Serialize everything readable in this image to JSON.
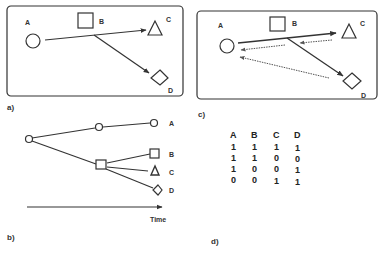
{
  "panels": {
    "a": {
      "caption": "a)",
      "nodes": [
        {
          "id": "A",
          "label": "A",
          "shape": "circle"
        },
        {
          "id": "B",
          "label": "B",
          "shape": "square"
        },
        {
          "id": "C",
          "label": "C",
          "shape": "triangle"
        },
        {
          "id": "D",
          "label": "D",
          "shape": "diamond"
        }
      ],
      "edges": [
        {
          "from": "A",
          "to": "C",
          "style": "solid"
        },
        {
          "from": "B",
          "to": "D",
          "style": "solid"
        }
      ]
    },
    "b": {
      "caption": "b)",
      "axis_label": "Time",
      "leaves": [
        {
          "id": "A",
          "label": "A",
          "shape": "circle"
        },
        {
          "id": "B",
          "label": "B",
          "shape": "square"
        },
        {
          "id": "C",
          "label": "C",
          "shape": "triangle"
        },
        {
          "id": "D",
          "label": "D",
          "shape": "diamond"
        }
      ]
    },
    "c": {
      "caption": "c)",
      "nodes": [
        {
          "id": "A",
          "label": "A",
          "shape": "circle"
        },
        {
          "id": "B",
          "label": "B",
          "shape": "square"
        },
        {
          "id": "C",
          "label": "C",
          "shape": "triangle"
        },
        {
          "id": "D",
          "label": "D",
          "shape": "diamond"
        }
      ],
      "edges": [
        {
          "from": "A",
          "to": "C",
          "style": "solid"
        },
        {
          "from": "B",
          "to": "D",
          "style": "solid"
        },
        {
          "from": "C",
          "to": "B",
          "style": "dotted"
        },
        {
          "from": "B",
          "to": "A",
          "style": "dotted"
        },
        {
          "from": "D",
          "to": "A",
          "style": "dotted"
        }
      ]
    },
    "d": {
      "caption": "d)",
      "headers": [
        "A",
        "B",
        "C",
        "D"
      ],
      "rows": [
        [
          "1",
          "1",
          "1",
          "1"
        ],
        [
          "1",
          "1",
          "0",
          "0"
        ],
        [
          "1",
          "0",
          "0",
          "1"
        ],
        [
          "0",
          "0",
          "1",
          "1"
        ]
      ]
    }
  },
  "colors": {
    "stroke": "#333333",
    "dotted": "#555555",
    "background": "#ffffff"
  }
}
